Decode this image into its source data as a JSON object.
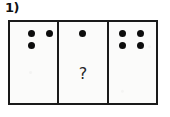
{
  "question": {
    "label": "1)"
  },
  "frame": {
    "border_color": "#1a1a1a",
    "panel_background": "#fbfbfa",
    "dot_color": "#0d0d0d"
  },
  "panels": [
    {
      "name": "panel-1",
      "dot_count": 3,
      "dot_layout": "two-top-one-bottom-left",
      "dots": [
        {
          "x": 21,
          "y": 31
        },
        {
          "x": 39,
          "y": 31
        },
        {
          "x": 21,
          "y": 43
        }
      ],
      "unknown": null
    },
    {
      "name": "panel-2",
      "dot_count": 1,
      "dot_layout": "one-top-center",
      "dots": [
        {
          "x": 50,
          "y": 31
        }
      ],
      "unknown": "?"
    },
    {
      "name": "panel-3",
      "dot_count": 4,
      "dot_layout": "two-by-two-grid",
      "dots": [
        {
          "x": 25,
          "y": 31
        },
        {
          "x": 43,
          "y": 31
        },
        {
          "x": 25,
          "y": 43
        },
        {
          "x": 43,
          "y": 43
        }
      ],
      "unknown": null
    }
  ]
}
